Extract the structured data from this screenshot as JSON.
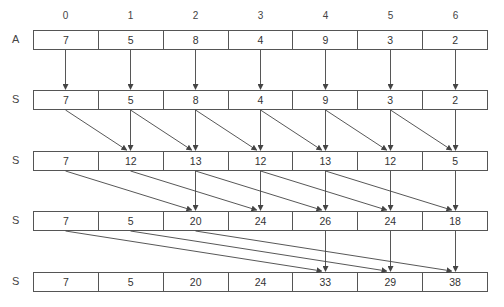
{
  "diagram": {
    "indices": [
      "0",
      "1",
      "2",
      "3",
      "4",
      "5",
      "6"
    ],
    "rows": [
      {
        "label": "A",
        "values": [
          "7",
          "5",
          "8",
          "4",
          "9",
          "3",
          "2"
        ]
      },
      {
        "label": "S",
        "values": [
          "7",
          "5",
          "8",
          "4",
          "9",
          "3",
          "2"
        ]
      },
      {
        "label": "S",
        "values": [
          "7",
          "12",
          "13",
          "12",
          "13",
          "12",
          "5"
        ]
      },
      {
        "label": "S",
        "values": [
          "7",
          "5",
          "20",
          "24",
          "26",
          "24",
          "18"
        ]
      },
      {
        "label": "S",
        "values": [
          "7",
          "5",
          "20",
          "24",
          "33",
          "29",
          "38"
        ]
      }
    ],
    "arrow_steps": [
      {
        "from_row": 0,
        "to_row": 1,
        "offset": 0
      },
      {
        "from_row": 1,
        "to_row": 2,
        "offset": 1
      },
      {
        "from_row": 2,
        "to_row": 3,
        "offset": 2
      },
      {
        "from_row": 3,
        "to_row": 4,
        "offset": 4
      }
    ],
    "colors": {
      "line": "#444444",
      "text": "#333333",
      "background": "#ffffff"
    }
  }
}
